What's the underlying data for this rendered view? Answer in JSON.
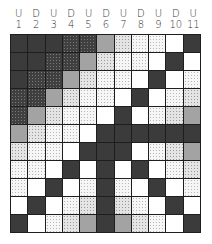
{
  "columns": [
    {
      "letter": "U",
      "number": "1"
    },
    {
      "letter": "D",
      "number": "2"
    },
    {
      "letter": "U",
      "number": "3"
    },
    {
      "letter": "D",
      "number": "4"
    },
    {
      "letter": "U",
      "number": "5"
    },
    {
      "letter": "D",
      "number": "6"
    },
    {
      "letter": "U",
      "number": "7"
    },
    {
      "letter": "D",
      "number": "8"
    },
    {
      "letter": "U",
      "number": "9"
    },
    {
      "letter": "D",
      "number": "10"
    },
    {
      "letter": "U",
      "number": "11"
    }
  ],
  "legend_textures": {
    "D": "dark solid",
    "DS": "dark speckled",
    "G": "medium gray solid",
    "S": "light gray speckled",
    "L": "sparse light dots",
    "W": "white"
  },
  "colors": {
    "D": "#3b3b3b",
    "DS": "#4f4f4f",
    "G": "#a3a3a3",
    "S": "#e4e4e4",
    "L": "#f6f6f6",
    "W": "#ffffff",
    "grid_line": "#1e1e1e"
  },
  "grid": [
    [
      "D",
      "D",
      "D",
      "DS",
      "DS",
      "G",
      "S",
      "L",
      "L",
      "W",
      "D"
    ],
    [
      "D",
      "D",
      "DS",
      "DS",
      "G",
      "S",
      "L",
      "L",
      "W",
      "D",
      "W"
    ],
    [
      "D",
      "DS",
      "DS",
      "G",
      "S",
      "L",
      "L",
      "W",
      "D",
      "W",
      "L"
    ],
    [
      "DS",
      "DS",
      "G",
      "S",
      "L",
      "L",
      "W",
      "D",
      "W",
      "L",
      "S"
    ],
    [
      "DS",
      "G",
      "S",
      "L",
      "L",
      "W",
      "D",
      "W",
      "L",
      "S",
      "G"
    ],
    [
      "G",
      "S",
      "L",
      "L",
      "W",
      "D",
      "D",
      "D",
      "D",
      "D",
      "D"
    ],
    [
      "S",
      "L",
      "L",
      "W",
      "D",
      "D",
      "D",
      "W",
      "L",
      "S",
      "G"
    ],
    [
      "L",
      "L",
      "W",
      "D",
      "W",
      "D",
      "W",
      "D",
      "W",
      "L",
      "S"
    ],
    [
      "L",
      "W",
      "D",
      "W",
      "L",
      "D",
      "L",
      "W",
      "D",
      "W",
      "L"
    ],
    [
      "W",
      "D",
      "W",
      "L",
      "S",
      "D",
      "S",
      "L",
      "W",
      "D",
      "W"
    ],
    [
      "D",
      "W",
      "L",
      "S",
      "G",
      "D",
      "G",
      "S",
      "L",
      "W",
      "D"
    ]
  ]
}
